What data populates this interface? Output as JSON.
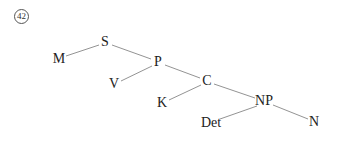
{
  "example_number": "42",
  "tree": {
    "nodes": [
      {
        "id": "S",
        "label": "S",
        "x": 105,
        "y": 42
      },
      {
        "id": "M",
        "label": "M",
        "x": 59,
        "y": 59
      },
      {
        "id": "P",
        "label": "P",
        "x": 158,
        "y": 62
      },
      {
        "id": "V",
        "label": "V",
        "x": 114,
        "y": 84
      },
      {
        "id": "C",
        "label": "C",
        "x": 207,
        "y": 81
      },
      {
        "id": "K",
        "label": "K",
        "x": 162,
        "y": 103
      },
      {
        "id": "NP",
        "label": "NP",
        "x": 264,
        "y": 101
      },
      {
        "id": "Det",
        "label": "Det",
        "x": 211,
        "y": 123
      },
      {
        "id": "N",
        "label": "N",
        "x": 314,
        "y": 122
      }
    ],
    "edges": [
      [
        "S",
        "M"
      ],
      [
        "S",
        "P"
      ],
      [
        "P",
        "V"
      ],
      [
        "P",
        "C"
      ],
      [
        "C",
        "K"
      ],
      [
        "C",
        "NP"
      ],
      [
        "NP",
        "Det"
      ],
      [
        "NP",
        "N"
      ]
    ]
  },
  "line_color": "#777777"
}
